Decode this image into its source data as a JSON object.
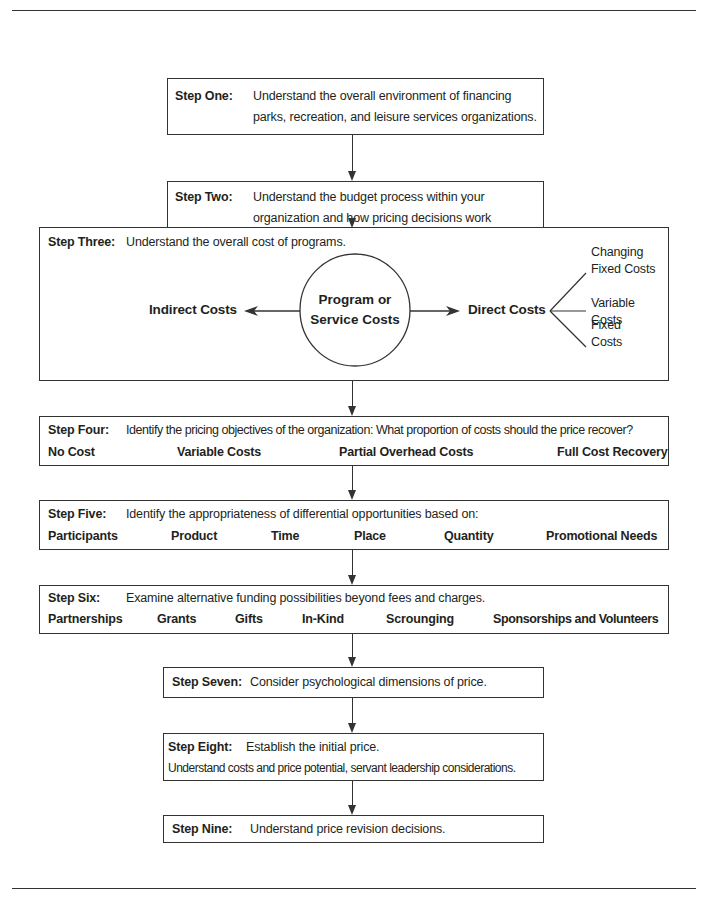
{
  "steps": {
    "one": {
      "label": "Step One:",
      "line1": "Understand the overall environment of financing",
      "line2": "parks, recreation, and leisure services organizations."
    },
    "two": {
      "label": "Step Two:",
      "line1": "Understand the budget process within your",
      "line2": "organization and how pricing decisions work",
      "line3": "within the budgeting process."
    },
    "three": {
      "label": "Step Three:",
      "text": "Understand the overall cost of programs.",
      "center": {
        "line1": "Program or",
        "line2": "Service Costs"
      },
      "indirect": "Indirect Costs",
      "direct": "Direct Costs",
      "branches": [
        {
          "line1": "Changing",
          "line2": "Fixed Costs"
        },
        {
          "line1": "Variable",
          "line2": "Costs"
        },
        {
          "line1": "Fixed",
          "line2": "Costs"
        }
      ]
    },
    "four": {
      "label": "Step Four:",
      "text": "Identify the pricing objectives of the organization:  What proportion of costs should the price recover?",
      "options": [
        "No Cost",
        "Variable Costs",
        "Partial Overhead Costs",
        "Full Cost Recovery"
      ]
    },
    "five": {
      "label": "Step Five:",
      "text": "Identify the appropriateness of differential opportunities based on:",
      "options": [
        "Participants",
        "Product",
        "Time",
        "Place",
        "Quantity",
        "Promotional Needs"
      ]
    },
    "six": {
      "label": "Step Six:",
      "text": "Examine alternative funding possibilities beyond fees and charges.",
      "options": [
        "Partnerships",
        "Grants",
        "Gifts",
        "In-Kind",
        "Scrounging",
        "Sponsorships and Volunteers"
      ]
    },
    "seven": {
      "label": "Step Seven:",
      "text": "Consider psychological dimensions of price."
    },
    "eight": {
      "label": "Step Eight:",
      "text": "Establish the initial price.",
      "line2": "Understand costs and price potential, servant leadership considerations."
    },
    "nine": {
      "label": "Step Nine:",
      "text": "Understand price revision decisions."
    }
  }
}
